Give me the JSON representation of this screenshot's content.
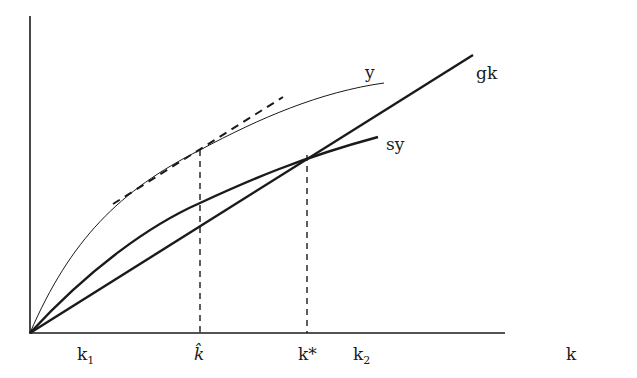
{
  "diagram": {
    "type": "solow-growth-diagram",
    "colors": {
      "ink": "#1a1a1a",
      "background": "#ffffff"
    },
    "axes": {
      "x_label": "k",
      "y_label": ""
    },
    "curves": [
      {
        "id": "y",
        "label": "y",
        "style": "thin solid",
        "shape": "concave"
      },
      {
        "id": "sy",
        "label": "sy",
        "style": "thick solid",
        "shape": "concave"
      },
      {
        "id": "gk",
        "label": "gk",
        "style": "thick solid",
        "shape": "linear"
      }
    ],
    "tangent_line": {
      "style": "dashed",
      "touches": "y at k-hat"
    },
    "x_ticks": [
      {
        "label": "k",
        "sub": "1"
      },
      {
        "label": "k̂",
        "sub": ""
      },
      {
        "label": "k*",
        "sub": ""
      },
      {
        "label": "k",
        "sub": "2"
      }
    ],
    "dropped_lines": [
      {
        "at": "k̂",
        "style": "dashed"
      },
      {
        "at": "k*",
        "style": "dashed"
      }
    ]
  }
}
